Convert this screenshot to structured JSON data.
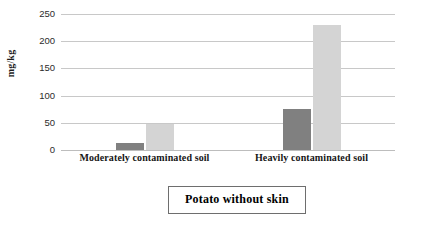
{
  "chart_data": {
    "type": "bar",
    "title": "",
    "subtitle": "",
    "xlabel": "",
    "ylabel": "mg/kg",
    "categories": [
      "Moderately contaminated soil",
      "Heavily contaminated soil"
    ],
    "series": [
      {
        "name": "series-1",
        "color": "#808080",
        "values": [
          13,
          75
        ]
      },
      {
        "name": "series-2",
        "color": "#d4d4d4",
        "values": [
          48,
          230
        ]
      }
    ],
    "yticks": [
      0,
      50,
      100,
      150,
      200,
      250
    ],
    "ylim": [
      0,
      250
    ],
    "grid": true,
    "legend": false,
    "legend_position": "none",
    "annotations": [
      "Potato without skin"
    ]
  },
  "caption": {
    "text": "Potato without skin"
  }
}
